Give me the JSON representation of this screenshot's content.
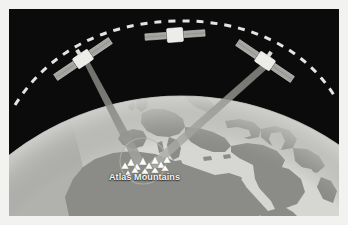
{
  "figure": {
    "frame_color": "#f2f2f0",
    "space_color": "#0b0b0b"
  },
  "labels": [
    {
      "id": "atlas-mountains",
      "text": "Atlas Mountains",
      "color": "#f4f4f2"
    }
  ],
  "earth": {
    "name": "earth-globe",
    "ocean_color": "#d6d6d2",
    "land_color": "#8e8e8a",
    "limb_color": "#9a9a99",
    "terminator_color": "#a8a8a6",
    "regions": [
      "Europe",
      "Africa",
      "Arabian Peninsula",
      "Mediterranean Sea",
      "Black Sea",
      "Caspian Sea",
      "Red Sea"
    ]
  },
  "orbit": {
    "name": "orbital-path",
    "style": "dashed",
    "color": "#f0f0ee",
    "dash_pattern": "7 7"
  },
  "satellites": [
    {
      "id": "satellite-left",
      "body_color": "#e8e8e4",
      "panel_color": "#a5a5a1"
    },
    {
      "id": "satellite-top",
      "body_color": "#e8e8e4",
      "panel_color": "#a5a5a1"
    },
    {
      "id": "satellite-right",
      "body_color": "#e8e8e4",
      "panel_color": "#a5a5a1"
    }
  ],
  "beams": [
    {
      "id": "beam-left",
      "from": "satellite-left",
      "to": "atlas-mountains",
      "color": "#8c8c88"
    },
    {
      "id": "beam-right",
      "from": "satellite-right",
      "to": "atlas-mountains",
      "color": "#9c9c98"
    }
  ],
  "target_marker": {
    "name": "atlas-mountains-marker",
    "symbol": "mountain-peaks",
    "symbol_count": 13,
    "symbol_color": "#fbfbf8",
    "circle_color": "#b4b4ae"
  }
}
